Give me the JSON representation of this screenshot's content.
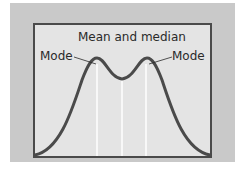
{
  "diagram": {
    "title": "Mean and median",
    "labels": {
      "mode_left": "Mode",
      "mode_right": "Mode"
    },
    "curve": {
      "type": "bimodal distribution",
      "stroke_color": "#4a4a4a",
      "stroke_width": 3
    },
    "marker_lines": {
      "color": "#ffffff",
      "count": 3,
      "meaning": [
        "mode",
        "mean and median",
        "mode"
      ]
    },
    "colors": {
      "panel_background": "#c9c9c9",
      "plot_background": "#e4e4e4",
      "frame_border": "#4a4a4a"
    }
  }
}
